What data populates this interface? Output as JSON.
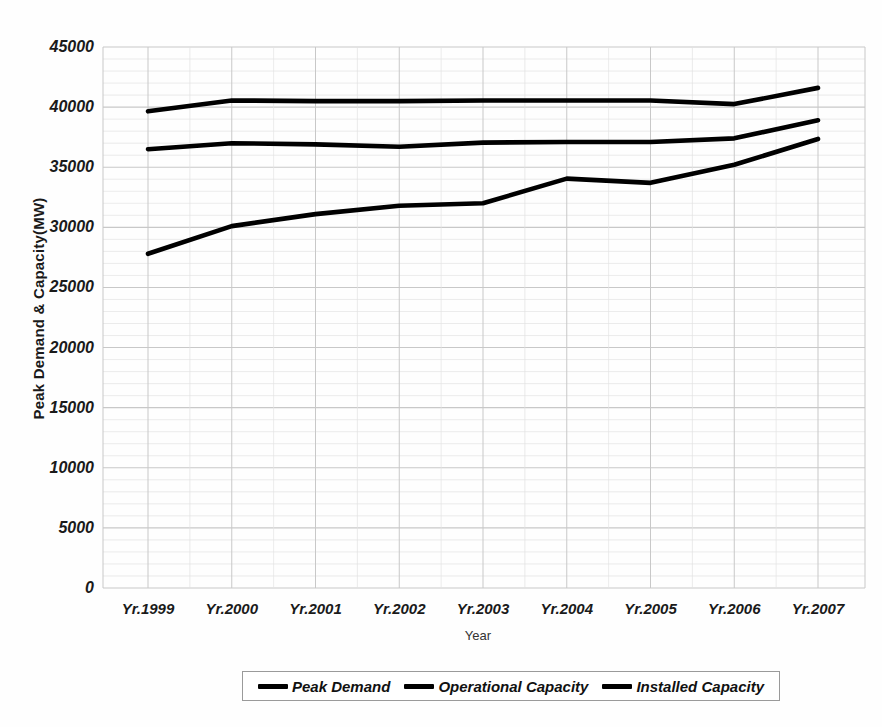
{
  "chart_data": {
    "type": "line",
    "title": "",
    "xlabel": "Year",
    "ylabel": "Peak Demand & Capacity(MW)",
    "categories": [
      "Yr.1999",
      "Yr.2000",
      "Yr.2001",
      "Yr.2002",
      "Yr.2003",
      "Yr.2004",
      "Yr.2005",
      "Yr.2006",
      "Yr.2007"
    ],
    "ylim": [
      0,
      45000
    ],
    "yticks": [
      "0",
      "5000",
      "10000",
      "15000",
      "20000",
      "25000",
      "30000",
      "35000",
      "40000",
      "45000"
    ],
    "ytick_values": [
      0,
      5000,
      10000,
      15000,
      20000,
      25000,
      30000,
      35000,
      40000,
      45000
    ],
    "grid": true,
    "minor_grid": true,
    "minor_grid_step": 1000,
    "legend_position": "bottom",
    "line_color": "#000000",
    "grid_color": "#c8c8c8",
    "minor_grid_color": "#e2e2e2",
    "series": [
      {
        "name": "Peak Demand",
        "values": [
          27800,
          30100,
          31100,
          31800,
          32000,
          34050,
          33700,
          35200,
          37350
        ]
      },
      {
        "name": "Operational Capacity",
        "values": [
          36500,
          37000,
          36900,
          36700,
          37050,
          37100,
          37100,
          37400,
          38900
        ]
      },
      {
        "name": "Installed Capacity",
        "values": [
          39650,
          40550,
          40500,
          40500,
          40550,
          40550,
          40550,
          40250,
          41600
        ]
      }
    ]
  }
}
